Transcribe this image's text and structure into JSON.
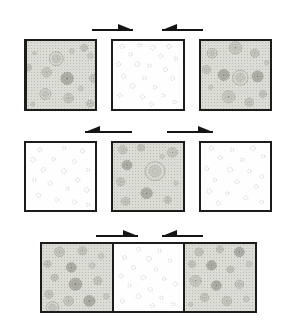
{
  "colors": {
    "border": "#1c1c1c",
    "shaded_bg": "#dcdcd6",
    "stipple": "#bcbcb5",
    "arrow": "#141414",
    "circle_stroke": "#8e8e87",
    "circle_fill": "#c9c9c2",
    "dark_fill": "#b1b1aa",
    "dark_stroke": "#7b7b74",
    "ring_fill": "#d7d7d1",
    "faint_stroke": "#c9c9c4"
  },
  "structure": {
    "rows": [
      {
        "panels": [
          "top_left",
          "top_mid",
          "top_right"
        ],
        "joined": false,
        "arrows": [
          "arrow-top-left",
          "arrow-top-right"
        ]
      },
      {
        "panels": [
          "mid_left",
          "mid_center",
          "mid_right"
        ],
        "joined": false,
        "arrows": [
          "arrow-mid-left",
          "arrow-mid-right"
        ]
      },
      {
        "panels": [
          "bot_left",
          "bot_mid",
          "bot_right"
        ],
        "joined": true,
        "arrows": [
          "arrow-bot-left",
          "arrow-bot-right"
        ]
      }
    ]
  },
  "arrows": [
    {
      "id": "arrow-top-left",
      "x": 92,
      "y": 30,
      "length": 41,
      "dir": "right"
    },
    {
      "id": "arrow-top-right",
      "x": 162,
      "y": 30,
      "length": 41,
      "dir": "left"
    },
    {
      "id": "arrow-mid-left",
      "x": 85,
      "y": 132,
      "length": 47,
      "dir": "left"
    },
    {
      "id": "arrow-mid-right",
      "x": 167,
      "y": 132,
      "length": 46,
      "dir": "right"
    },
    {
      "id": "arrow-bot-left",
      "x": 96,
      "y": 236,
      "length": 42,
      "dir": "right"
    },
    {
      "id": "arrow-bot-right",
      "x": 162,
      "y": 236,
      "length": 41,
      "dir": "left"
    }
  ],
  "panels": {
    "top_left": {
      "type": "shaded",
      "circles": [
        [
          43,
          26,
          10,
          "ring"
        ],
        [
          84,
          10,
          5,
          "rosette"
        ],
        [
          93,
          22,
          4,
          "dot"
        ],
        [
          66,
          15,
          3.5,
          "dot"
        ],
        [
          11,
          18,
          2.5,
          "dot"
        ],
        [
          2,
          39,
          5,
          "rosette"
        ],
        [
          29,
          46,
          7,
          "rosette"
        ],
        [
          59,
          55,
          9,
          "dark"
        ],
        [
          98,
          55,
          6,
          "rosette"
        ],
        [
          27,
          78,
          8,
          "ring"
        ],
        [
          61,
          84,
          7,
          "rosette"
        ],
        [
          79,
          70,
          3.5,
          "dot"
        ],
        [
          93,
          92,
          5,
          "rosette"
        ],
        [
          8,
          93,
          3,
          "dot"
        ]
      ]
    },
    "top_mid": {
      "type": "white",
      "circles": [
        [
          13,
          8,
          3
        ],
        [
          38,
          6,
          2.5
        ],
        [
          57,
          10,
          3.5
        ],
        [
          80,
          8,
          3
        ],
        [
          25,
          20,
          2.5
        ],
        [
          68,
          22,
          3
        ],
        [
          90,
          26,
          2.5
        ],
        [
          8,
          34,
          3
        ],
        [
          35,
          34,
          3.5
        ],
        [
          52,
          36,
          2.5
        ],
        [
          75,
          42,
          3
        ],
        [
          15,
          52,
          3
        ],
        [
          45,
          55,
          2.5
        ],
        [
          85,
          55,
          3
        ],
        [
          28,
          66,
          3.5
        ],
        [
          60,
          68,
          2.5
        ],
        [
          10,
          80,
          3
        ],
        [
          42,
          82,
          3
        ],
        [
          72,
          80,
          2.5
        ],
        [
          55,
          93,
          3
        ],
        [
          88,
          90,
          2.5
        ]
      ]
    },
    "top_right": {
      "type": "shaded",
      "circles": [
        [
          50,
          10,
          9,
          "rosette"
        ],
        [
          16,
          18,
          7,
          "ring"
        ],
        [
          78,
          18,
          6,
          "rosette"
        ],
        [
          95,
          32,
          3,
          "dot"
        ],
        [
          8,
          42,
          6,
          "rosette"
        ],
        [
          33,
          50,
          8,
          "dark"
        ],
        [
          57,
          54,
          11,
          "ring"
        ],
        [
          82,
          52,
          8,
          "dark"
        ],
        [
          14,
          68,
          3,
          "dot"
        ],
        [
          40,
          82,
          9,
          "rosette"
        ],
        [
          70,
          90,
          6,
          "rosette"
        ],
        [
          90,
          78,
          5,
          "ring"
        ]
      ]
    },
    "mid_left": {
      "type": "white",
      "circles": [
        [
          20,
          10,
          3
        ],
        [
          55,
          8,
          2.5
        ],
        [
          82,
          12,
          3
        ],
        [
          10,
          25,
          3.5
        ],
        [
          40,
          24,
          2.5
        ],
        [
          70,
          28,
          3
        ],
        [
          90,
          40,
          2.5
        ],
        [
          25,
          40,
          3
        ],
        [
          55,
          42,
          3.5
        ],
        [
          12,
          55,
          2.5
        ],
        [
          75,
          55,
          3
        ],
        [
          35,
          60,
          3
        ],
        [
          60,
          68,
          2.5
        ],
        [
          88,
          70,
          3.5
        ],
        [
          18,
          78,
          3
        ],
        [
          45,
          85,
          2.5
        ],
        [
          70,
          88,
          3
        ],
        [
          90,
          92,
          2.5
        ]
      ]
    },
    "mid_center": {
      "type": "shaded",
      "circles": [
        [
          14,
          10,
          6,
          "ring"
        ],
        [
          40,
          7,
          5,
          "rosette"
        ],
        [
          85,
          14,
          7,
          "rosette"
        ],
        [
          20,
          33,
          7,
          "dark"
        ],
        [
          60,
          42,
          14,
          "ring"
        ],
        [
          11,
          58,
          6,
          "rosette"
        ],
        [
          48,
          75,
          8,
          "dark"
        ],
        [
          18,
          87,
          6,
          "rosette"
        ],
        [
          78,
          85,
          5,
          "rosette"
        ],
        [
          90,
          60,
          3,
          "dot"
        ],
        [
          70,
          20,
          3,
          "dot"
        ]
      ]
    },
    "mid_right": {
      "type": "white",
      "circles": [
        [
          15,
          8,
          3
        ],
        [
          45,
          10,
          2.5
        ],
        [
          75,
          8,
          3.5
        ],
        [
          90,
          20,
          2.5
        ],
        [
          28,
          22,
          3
        ],
        [
          60,
          25,
          2.5
        ],
        [
          8,
          38,
          3
        ],
        [
          42,
          40,
          3.5
        ],
        [
          70,
          42,
          2.5
        ],
        [
          88,
          50,
          3
        ],
        [
          20,
          55,
          2.5
        ],
        [
          52,
          58,
          3
        ],
        [
          80,
          65,
          3
        ],
        [
          12,
          72,
          3.5
        ],
        [
          38,
          75,
          2.5
        ],
        [
          65,
          82,
          3
        ],
        [
          88,
          88,
          2.5
        ],
        [
          25,
          90,
          3
        ]
      ]
    },
    "bot_left": {
      "type": "shaded",
      "circles": [
        [
          25,
          12,
          7,
          "rosette"
        ],
        [
          58,
          10,
          6,
          "rosette"
        ],
        [
          85,
          18,
          4,
          "dot"
        ],
        [
          8,
          30,
          5,
          "rosette"
        ],
        [
          42,
          35,
          7,
          "dark"
        ],
        [
          72,
          32,
          4,
          "dot"
        ],
        [
          18,
          50,
          5,
          "rosette"
        ],
        [
          48,
          60,
          9,
          "dark"
        ],
        [
          80,
          55,
          6,
          "rosette"
        ],
        [
          10,
          75,
          6,
          "rosette"
        ],
        [
          38,
          85,
          7,
          "rosette"
        ],
        [
          68,
          85,
          8,
          "dark"
        ],
        [
          92,
          78,
          4,
          "dot"
        ],
        [
          15,
          95,
          9,
          "ring"
        ]
      ]
    },
    "bot_mid": {
      "type": "white",
      "circles": [
        [
          35,
          8,
          3
        ],
        [
          65,
          10,
          2.5
        ],
        [
          15,
          20,
          3
        ],
        [
          50,
          22,
          3.5
        ],
        [
          80,
          25,
          2.5
        ],
        [
          28,
          35,
          3
        ],
        [
          60,
          38,
          2.5
        ],
        [
          10,
          48,
          3
        ],
        [
          42,
          50,
          3.5
        ],
        [
          72,
          52,
          2.5
        ],
        [
          88,
          60,
          3
        ],
        [
          22,
          62,
          2.5
        ],
        [
          52,
          68,
          3
        ],
        [
          35,
          78,
          3.5
        ],
        [
          68,
          80,
          2.5
        ],
        [
          12,
          85,
          3
        ],
        [
          55,
          92,
          3
        ],
        [
          85,
          90,
          2.5
        ]
      ]
    },
    "bot_right": {
      "type": "shaded",
      "circles": [
        [
          20,
          12,
          6,
          "rosette"
        ],
        [
          50,
          8,
          5,
          "ring"
        ],
        [
          78,
          12,
          7,
          "dark"
        ],
        [
          92,
          30,
          4,
          "dot"
        ],
        [
          10,
          30,
          5,
          "rosette"
        ],
        [
          38,
          32,
          7,
          "dark"
        ],
        [
          65,
          38,
          5,
          "rosette"
        ],
        [
          15,
          55,
          8,
          "rosette"
        ],
        [
          45,
          62,
          7,
          "dark"
        ],
        [
          78,
          60,
          6,
          "ring"
        ],
        [
          28,
          80,
          6,
          "rosette"
        ],
        [
          60,
          85,
          7,
          "rosette"
        ],
        [
          88,
          82,
          4,
          "dot"
        ],
        [
          8,
          90,
          3,
          "dot"
        ]
      ]
    }
  }
}
